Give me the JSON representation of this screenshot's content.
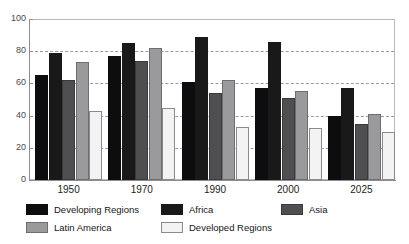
{
  "chart_data": {
    "type": "bar",
    "title": "",
    "xlabel": "",
    "ylabel": "",
    "ylim": [
      0,
      100
    ],
    "yticks": [
      0,
      20,
      40,
      60,
      80,
      100
    ],
    "grid": true,
    "legend_position": "bottom",
    "categories": [
      "1950",
      "1970",
      "1990",
      "2000",
      "2025"
    ],
    "series": [
      {
        "name": "Developing Regions",
        "color": "#0d0d0f",
        "values": [
          65,
          77,
          61,
          57,
          40
        ]
      },
      {
        "name": "Africa",
        "color": "#191919",
        "values": [
          79,
          85,
          89,
          86,
          57
        ]
      },
      {
        "name": "Asia",
        "color": "#4f4f52",
        "values": [
          62,
          74,
          54,
          51,
          35
        ]
      },
      {
        "name": "Latin America",
        "color": "#9a9a9d",
        "values": [
          73,
          82,
          62,
          55,
          41
        ]
      },
      {
        "name": "Developed Regions",
        "color": "#f3f3f3",
        "values": [
          43,
          45,
          33,
          32,
          30
        ]
      }
    ]
  },
  "legend": {
    "rows": [
      [
        {
          "label": "Developing Regions",
          "swatch": "c0"
        },
        {
          "label": "Africa",
          "swatch": "c1"
        },
        {
          "label": "Asia",
          "swatch": "c2"
        }
      ],
      [
        {
          "label": "Latin America",
          "swatch": "c3"
        },
        {
          "label": "Developed Regions",
          "swatch": "c4"
        }
      ]
    ]
  },
  "top_sliver_text": ""
}
